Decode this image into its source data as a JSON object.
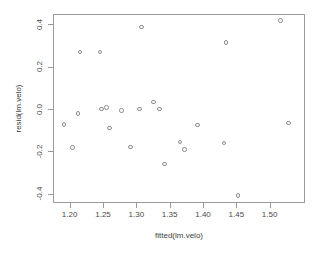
{
  "chart_data": {
    "type": "scatter",
    "title": "",
    "xlabel": "fitted(lm.velo)",
    "ylabel": "resid(lm.velo)",
    "xlim": [
      1.175,
      1.553
    ],
    "ylim": [
      -0.443,
      0.448
    ],
    "xticks": [
      "1.20",
      "1.25",
      "1.30",
      "1.35",
      "1.40",
      "1.45",
      "1.50"
    ],
    "xtick_values": [
      1.2,
      1.25,
      1.3,
      1.35,
      1.4,
      1.45,
      1.5
    ],
    "yticks": [
      "0.4",
      "0.2",
      "0.0",
      "-0.2",
      "-0.4"
    ],
    "ytick_values": [
      0.4,
      0.2,
      0.0,
      -0.2,
      -0.4
    ],
    "grid": false,
    "legend": null,
    "marker": "open-circle",
    "marker_color": "#8d8d93",
    "panel_border_color": "#9a9a9a",
    "points": [
      {
        "x": 1.19,
        "y": -0.068
      },
      {
        "x": 1.203,
        "y": -0.177
      },
      {
        "x": 1.211,
        "y": -0.017
      },
      {
        "x": 1.214,
        "y": 0.274
      },
      {
        "x": 1.244,
        "y": 0.273
      },
      {
        "x": 1.246,
        "y": 0.005
      },
      {
        "x": 1.254,
        "y": 0.012
      },
      {
        "x": 1.258,
        "y": -0.084
      },
      {
        "x": 1.276,
        "y": -0.003
      },
      {
        "x": 1.29,
        "y": -0.174
      },
      {
        "x": 1.303,
        "y": 0.006
      },
      {
        "x": 1.306,
        "y": 0.391
      },
      {
        "x": 1.324,
        "y": 0.039
      },
      {
        "x": 1.333,
        "y": 0.004
      },
      {
        "x": 1.341,
        "y": -0.254
      },
      {
        "x": 1.364,
        "y": -0.151
      },
      {
        "x": 1.371,
        "y": -0.186
      },
      {
        "x": 1.39,
        "y": -0.07
      },
      {
        "x": 1.43,
        "y": -0.156
      },
      {
        "x": 1.433,
        "y": 0.318
      },
      {
        "x": 1.451,
        "y": -0.403
      },
      {
        "x": 1.515,
        "y": 0.423
      },
      {
        "x": 1.527,
        "y": -0.06
      }
    ]
  }
}
